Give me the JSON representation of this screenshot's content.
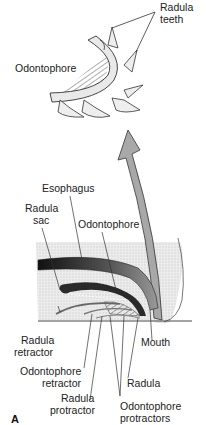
{
  "figure": {
    "panel_label": "A",
    "top_detail": {
      "labels": {
        "radula_teeth_1": "Radula",
        "radula_teeth_2": "teeth",
        "odontophore": "Odontophore"
      }
    },
    "main_diagram": {
      "labels": {
        "esophagus": "Esophagus",
        "radula_sac_1": "Radula",
        "radula_sac_2": "sac",
        "odontophore": "Odontophore",
        "mouth": "Mouth",
        "radula_retractor_1": "Radula",
        "radula_retractor_2": "retractor",
        "odontophore_retractor_1": "Odontophore",
        "odontophore_retractor_2": "retractor",
        "radula": "Radula",
        "radula_protractor_1": "Radula",
        "radula_protractor_2": "protractor",
        "odontophore_protractors_1": "Odontophore",
        "odontophore_protractors_2": "protractors"
      }
    },
    "colors": {
      "ink": "#222222",
      "arrow_fill": "#a8a8a8",
      "tissue_stipple": "#e6e6e6",
      "dark_radula": "#2a2a2a"
    }
  }
}
